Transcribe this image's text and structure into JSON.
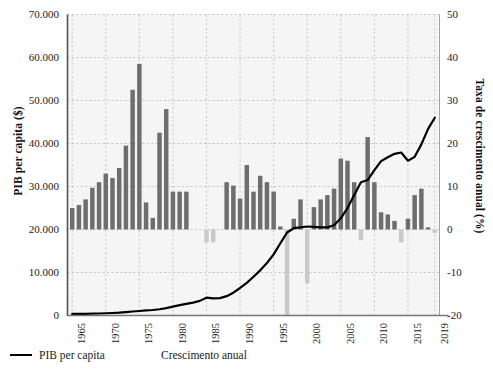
{
  "chart_data": {
    "type": "bar",
    "title": "",
    "subtitle": "",
    "xlabel": "",
    "ylabel": "PIB per capita ($)",
    "y2label": "Taxa de crescimento anual (%)",
    "xlim": [
      1964.3,
      2019.7
    ],
    "ylim": [
      0,
      70000
    ],
    "y2lim": [
      -20,
      50
    ],
    "grid": true,
    "legend_position": "bottom-left",
    "colors": {
      "line": "#000000",
      "bar_positive": "#6e6e6e",
      "bar_negative": "#c9c9c9",
      "grid": "#b9b9b9",
      "axis": "#6d6d6d",
      "plot_background": "#f5f5f5"
    },
    "y_ticks": [
      "0",
      "10.000",
      "20.000",
      "30.000",
      "40.000",
      "50.000",
      "60.000",
      "70.000"
    ],
    "y_tick_values": [
      0,
      10000,
      20000,
      30000,
      40000,
      50000,
      60000,
      70000
    ],
    "y2_ticks": [
      "-20",
      "-10",
      "0",
      "10",
      "20",
      "30",
      "40",
      "50"
    ],
    "y2_tick_values": [
      -20,
      -10,
      0,
      10,
      20,
      30,
      40,
      50
    ],
    "x_ticks": [
      "1965",
      "1970",
      "1975",
      "1980",
      "1985",
      "1990",
      "1995",
      "2000",
      "2005",
      "2010",
      "2015",
      "2019"
    ],
    "x_tick_values": [
      1965,
      1970,
      1975,
      1980,
      1985,
      1990,
      1995,
      2000,
      2005,
      2010,
      2015,
      2019
    ],
    "x": [
      1965,
      1966,
      1967,
      1968,
      1969,
      1970,
      1971,
      1972,
      1973,
      1974,
      1975,
      1976,
      1977,
      1978,
      1979,
      1980,
      1981,
      1982,
      1983,
      1984,
      1985,
      1986,
      1987,
      1988,
      1989,
      1990,
      1991,
      1992,
      1993,
      1994,
      1995,
      1996,
      1997,
      1998,
      1999,
      2000,
      2001,
      2002,
      2003,
      2004,
      2005,
      2006,
      2007,
      2008,
      2009,
      2010,
      2011,
      2012,
      2013,
      2014,
      2015,
      2016,
      2017,
      2018,
      2019
    ],
    "series": [
      {
        "name": "PIB per capita",
        "type": "line",
        "axis": "left",
        "unit": "$",
        "values": [
          360,
          380,
          400,
          430,
          470,
          520,
          580,
          660,
          790,
          930,
          1050,
          1180,
          1280,
          1450,
          1700,
          2050,
          2400,
          2700,
          3000,
          3400,
          4150,
          4000,
          4050,
          4500,
          5300,
          6400,
          7600,
          9000,
          10500,
          12200,
          14200,
          16800,
          19300,
          20300,
          20500,
          20700,
          20600,
          20500,
          20500,
          21000,
          22600,
          25000,
          28000,
          31000,
          31500,
          33800,
          35900,
          36800,
          37600,
          37900,
          36000,
          36900,
          39800,
          43400,
          46000
        ]
      },
      {
        "name": "Crescimento anual",
        "type": "bar",
        "axis": "right",
        "unit": "%",
        "values": [
          5.0,
          5.7,
          7.0,
          9.7,
          11.0,
          13.0,
          12.0,
          14.3,
          19.5,
          32.5,
          38.5,
          6.3,
          2.7,
          22.5,
          28.0,
          8.8,
          8.8,
          8.8,
          null,
          null,
          -3.0,
          -3.0,
          null,
          11.0,
          10.2,
          7.2,
          15.0,
          8.8,
          12.5,
          11.0,
          8.8,
          0.7,
          -20.0,
          2.5,
          7.0,
          -12.5,
          5.2,
          7.0,
          8.0,
          9.5,
          16.5,
          16.0,
          11.0,
          -2.5,
          21.5,
          11.0,
          4.0,
          3.5,
          2.0,
          -3.0,
          2.5,
          8.0,
          9.5,
          0.5,
          -0.8
        ]
      }
    ]
  },
  "legend": {
    "line_label": "PIB per capita",
    "bar_label": "Crescimento anual"
  }
}
